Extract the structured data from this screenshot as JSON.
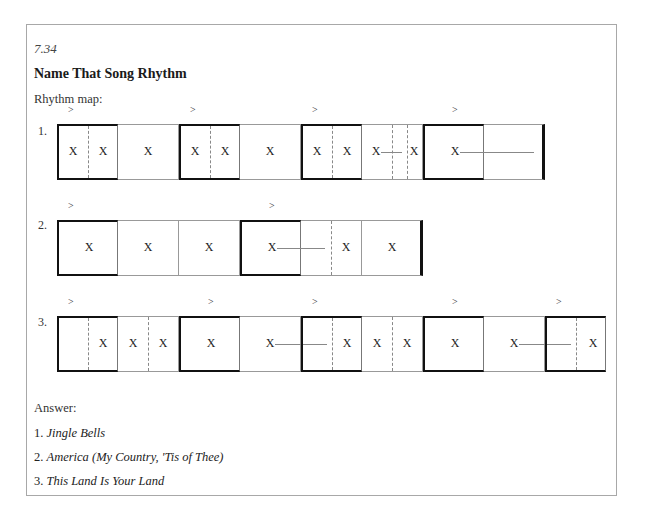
{
  "document": {
    "exercise_number": "7.34",
    "title": "Name That Song Rhythm",
    "rhythm_map_label": "Rhythm map:",
    "answer_label": "Answer:"
  },
  "glyphs": {
    "accent": ">",
    "beat": "X"
  },
  "rows": [
    {
      "label": "1.",
      "cells": [
        {
          "accent": true,
          "beats": "XX"
        },
        {
          "accent": false,
          "beats": "X"
        },
        {
          "accent": true,
          "beats": "XX"
        },
        {
          "accent": false,
          "beats": "X"
        },
        {
          "accent": true,
          "beats": "XX"
        },
        {
          "accent": false,
          "beats": "X-X (dotted, split)"
        },
        {
          "accent": true,
          "beats": "X (held)"
        },
        {
          "accent": false,
          "beats": "(tie continued)",
          "end": true
        }
      ]
    },
    {
      "label": "2.",
      "cells": [
        {
          "accent": true,
          "beats": "X"
        },
        {
          "accent": false,
          "beats": "X"
        },
        {
          "accent": false,
          "beats": "X"
        },
        {
          "accent": true,
          "beats": "X (held)"
        },
        {
          "accent": false,
          "beats": "(tie) | X"
        },
        {
          "accent": false,
          "beats": "X",
          "end": true
        }
      ]
    },
    {
      "label": "3.",
      "cells": [
        {
          "accent": true,
          "beats": "rest | X"
        },
        {
          "accent": false,
          "beats": "XX"
        },
        {
          "accent": true,
          "beats": "X"
        },
        {
          "accent": false,
          "beats": "X (held)"
        },
        {
          "accent": true,
          "beats": "(tie) | X"
        },
        {
          "accent": false,
          "beats": "XX"
        },
        {
          "accent": true,
          "beats": "X"
        },
        {
          "accent": false,
          "beats": "X (held)"
        },
        {
          "accent": true,
          "beats": "(tie) | X"
        }
      ]
    }
  ],
  "answers": [
    {
      "number": "1.",
      "song": "Jingle Bells"
    },
    {
      "number": "2.",
      "song": "America (My Country, 'Tis of Thee)"
    },
    {
      "number": "3.",
      "song": "This Land Is Your Land"
    }
  ]
}
